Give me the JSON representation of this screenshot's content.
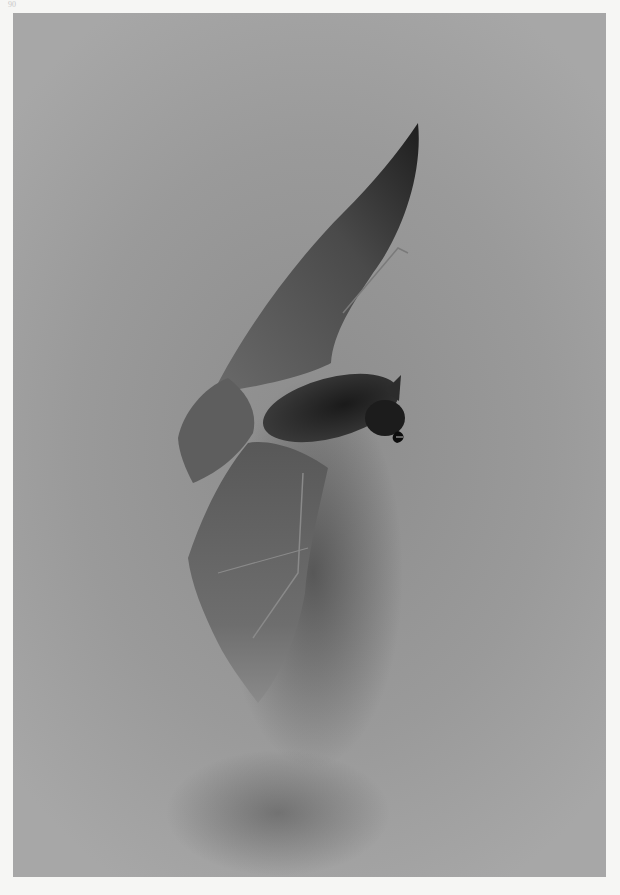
{
  "page": {
    "page_number": "90"
  },
  "plate": {
    "subject": "bat in flight",
    "description": "Black-and-white photographic plate of a bat with wings spread, flying diagonally upward, head facing right with mouth open",
    "colors": {
      "page_background": "#f6f6f4",
      "photo_background": "#9a9a9a",
      "wing_membrane": "#5a5a5a",
      "body_fur": "#2a2a2a",
      "shadow": "#3c3c3c"
    }
  }
}
